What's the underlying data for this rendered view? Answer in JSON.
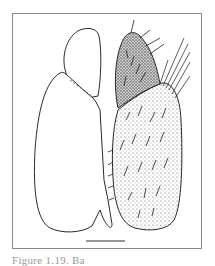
{
  "figure": {
    "caption": "Figure 1.19. Ba",
    "scale_bar": {
      "x1": 86,
      "x2": 125,
      "y": 241
    }
  },
  "colors": {
    "line": "#2a2a2a",
    "stipple_light": "#d8d8d8",
    "stipple_dark": "#9c9c9c",
    "frame": "#8a8a8a",
    "caption": "#9a9a9a"
  }
}
